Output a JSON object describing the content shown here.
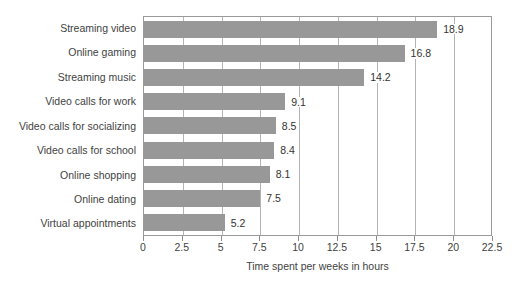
{
  "chart_data": {
    "type": "bar",
    "orientation": "horizontal",
    "title": "",
    "xlabel": "Time spent per weeks in hours",
    "ylabel": "",
    "categories": [
      "Streaming video",
      "Online gaming",
      "Streaming music",
      "Video calls for work",
      "Video calls for socializing",
      "Video calls for school",
      "Online shopping",
      "Online dating",
      "Virtual appointments"
    ],
    "values": [
      18.9,
      16.8,
      14.2,
      9.1,
      8.5,
      8.4,
      8.1,
      7.5,
      5.2
    ],
    "value_labels": [
      "18.9",
      "16.8",
      "14.2",
      "9.1",
      "8.5",
      "8.4",
      "8.1",
      "7.5",
      "5.2"
    ],
    "xlim": [
      0,
      22.5
    ],
    "xticks": [
      0,
      2.5,
      5,
      7.5,
      10,
      12.5,
      15,
      17.5,
      20,
      22.5
    ],
    "xtick_labels": [
      "0",
      "2.5",
      "5",
      "7.5",
      "10",
      "12.5",
      "15",
      "17.5",
      "20",
      "22.5"
    ],
    "grid": true,
    "grid_axis": "x",
    "legend": false,
    "bar_color": "#989898",
    "grid_color": "#b4b4b4",
    "axis_color": "#9a9a9a",
    "text_color": "#3f3f3f"
  }
}
